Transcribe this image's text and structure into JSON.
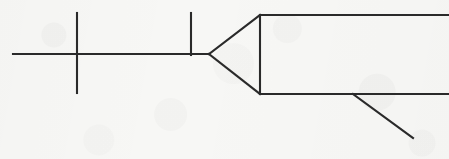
{
  "document": {
    "kind": "scanned-line-drawing",
    "title": "Line diagram",
    "description": "Hand-drawn black line schematic on off-white scanned paper: a horizontal centerline crossed by two vertical tick lines, meeting a leftward-pointing triangular arrowhead whose vertical base opens into two long horizontal rails extending off the right edge, with one diagonal branch dropping from the lower rail.",
    "width": 449,
    "height": 159
  },
  "canvas": {
    "width": 449,
    "height": 159,
    "background_color": "#f6f6f4",
    "paper_tone": "#f7f7f5"
  },
  "style": {
    "stroke_color": "#2a2a2a",
    "stroke_width": 2.1,
    "stroke_linecap": "square",
    "fill": "none"
  },
  "chart_data": {
    "type": "line",
    "xlabel": "",
    "ylabel": "",
    "xlim": [
      0,
      449
    ],
    "ylim": [
      0,
      159
    ],
    "grid": false,
    "legend": "none",
    "series": [
      {
        "name": "centerline",
        "role": "horizontal-centerline",
        "x": [
          13,
          209
        ],
        "y": [
          54,
          54
        ]
      },
      {
        "name": "tick-left",
        "role": "vertical-tick",
        "x": [
          77,
          77
        ],
        "y": [
          13,
          93
        ]
      },
      {
        "name": "tick-right",
        "role": "vertical-tick",
        "x": [
          191,
          191
        ],
        "y": [
          13,
          55
        ]
      },
      {
        "name": "arrow-upper-edge",
        "role": "triangle-edge",
        "x": [
          209,
          260
        ],
        "y": [
          54,
          15
        ]
      },
      {
        "name": "arrow-lower-edge",
        "role": "triangle-edge",
        "x": [
          209,
          260
        ],
        "y": [
          54,
          94
        ]
      },
      {
        "name": "arrow-base",
        "role": "triangle-base",
        "x": [
          260,
          260
        ],
        "y": [
          15,
          94
        ]
      },
      {
        "name": "rail-top",
        "role": "horizontal-rail",
        "x": [
          260,
          449
        ],
        "y": [
          15,
          15
        ]
      },
      {
        "name": "rail-bottom",
        "role": "horizontal-rail",
        "x": [
          260,
          449
        ],
        "y": [
          94,
          94
        ]
      },
      {
        "name": "branch-diagonal",
        "role": "diagonal-branch",
        "x": [
          353,
          413
        ],
        "y": [
          94,
          138
        ]
      }
    ],
    "vertices": {
      "centerline_left_end": [
        13,
        54
      ],
      "tick_left_x": 77,
      "tick_right_x": 191,
      "arrow_tip": [
        209,
        54
      ],
      "arrow_base_top": [
        260,
        15
      ],
      "arrow_base_bottom": [
        260,
        94
      ],
      "branch_origin": [
        353,
        94
      ],
      "branch_end": [
        413,
        138
      ],
      "rails_right_edge_x": 449
    }
  }
}
